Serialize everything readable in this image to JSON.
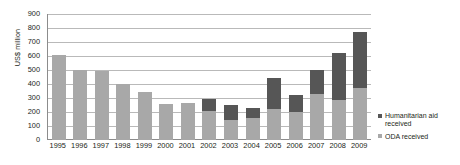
{
  "chart_data": {
    "type": "bar",
    "title": "",
    "subtitle": "",
    "xlabel": "",
    "ylabel": "US$ million",
    "ylim": [
      0,
      900
    ],
    "ytick_step": 100,
    "yticks": [
      900,
      800,
      700,
      600,
      500,
      400,
      300,
      200,
      100,
      0
    ],
    "grid": true,
    "stacked": true,
    "legend_position": "right-bottom",
    "categories": [
      "1995",
      "1996",
      "1997",
      "1998",
      "1999",
      "2000",
      "2001",
      "2002",
      "2003",
      "2004",
      "2005",
      "2006",
      "2007",
      "2008",
      "2009"
    ],
    "series": [
      {
        "name": "ODA received",
        "color": "#a8a8a8",
        "values": [
          605,
          500,
          492,
          397,
          342,
          260,
          263,
          205,
          145,
          160,
          220,
          198,
          330,
          285,
          375
        ]
      },
      {
        "name": "Humanitarian aid received",
        "color": "#565656",
        "values": [
          0,
          0,
          0,
          0,
          0,
          0,
          0,
          90,
          103,
          68,
          222,
          120,
          168,
          337,
          400
        ]
      }
    ],
    "totals": [
      605,
      500,
      492,
      397,
      342,
      260,
      263,
      295,
      248,
      228,
      442,
      318,
      498,
      622,
      775
    ]
  },
  "legend": {
    "entries": [
      {
        "label": "Humanitarian aid received",
        "key": "hum"
      },
      {
        "label": "ODA received",
        "key": "oda"
      }
    ]
  },
  "axis": {
    "y_title": "US$ million"
  },
  "colors": {
    "humanitarian": "#565656",
    "oda": "#a8a8a8",
    "gridline": "#b9b9b9",
    "axis": "#8c8c8c",
    "text": "#231f20",
    "background": "#ffffff"
  }
}
